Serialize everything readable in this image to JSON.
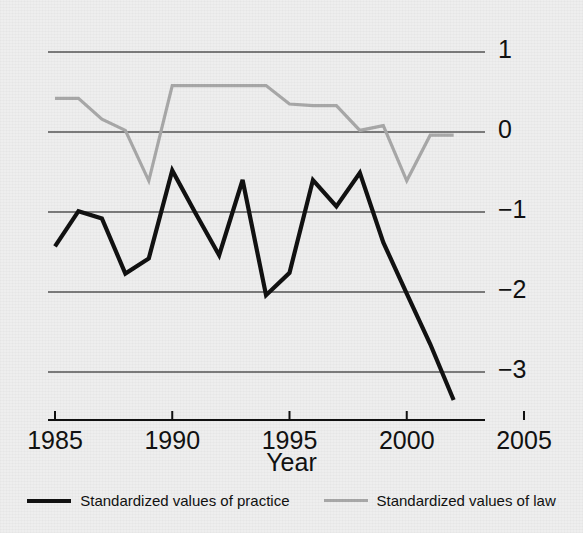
{
  "chart_data": {
    "type": "line",
    "title": "",
    "xlabel": "Year",
    "ylabel": "",
    "xlim": [
      1985,
      2005
    ],
    "ylim": [
      -3.6,
      1.4
    ],
    "grid": true,
    "grid_axis": "y",
    "legend_position": "bottom",
    "x_ticks": [
      "1985",
      "1990",
      "1995",
      "2000",
      "2005"
    ],
    "x_tick_values": [
      1985,
      1990,
      1995,
      2000,
      2005
    ],
    "y_ticks": [
      "1",
      "0",
      "−1",
      "−2",
      "−3"
    ],
    "y_tick_values": [
      1,
      0,
      -1,
      -2,
      -3
    ],
    "x": [
      1985,
      1986,
      1987,
      1988,
      1989,
      1990,
      1991,
      1992,
      1993,
      1994,
      1995,
      1996,
      1997,
      1998,
      1999,
      2000,
      2001,
      2002
    ],
    "series": [
      {
        "name": "Standardized values of practice",
        "color": "#111111",
        "values": [
          -1.43,
          -0.99,
          -1.08,
          -1.77,
          -1.58,
          -0.48,
          -1.02,
          -1.54,
          -0.6,
          -2.04,
          -1.76,
          -0.6,
          -0.93,
          -0.51,
          -1.38,
          -2.02,
          -2.65,
          -3.35
        ]
      },
      {
        "name": "Standardized values of law",
        "color": "#a8a8a8",
        "values": [
          0.42,
          0.42,
          0.16,
          0.02,
          -0.61,
          0.58,
          0.58,
          0.58,
          0.58,
          0.58,
          0.35,
          0.33,
          0.33,
          0.02,
          0.08,
          -0.61,
          -0.04,
          -0.04
        ]
      }
    ]
  },
  "legend": {
    "entries": [
      {
        "label": "Standardized values of practice",
        "swatch": "solid-black-line"
      },
      {
        "label": "Standardized values of law",
        "swatch": "solid-gray-line"
      }
    ]
  },
  "axes": {
    "x_title": "Year"
  },
  "colors": {
    "background": "#eeeeee",
    "practice_line": "#111111",
    "law_line": "#a8a8a8",
    "gridline": "#555555",
    "axis": "#111111",
    "text": "#111111"
  }
}
